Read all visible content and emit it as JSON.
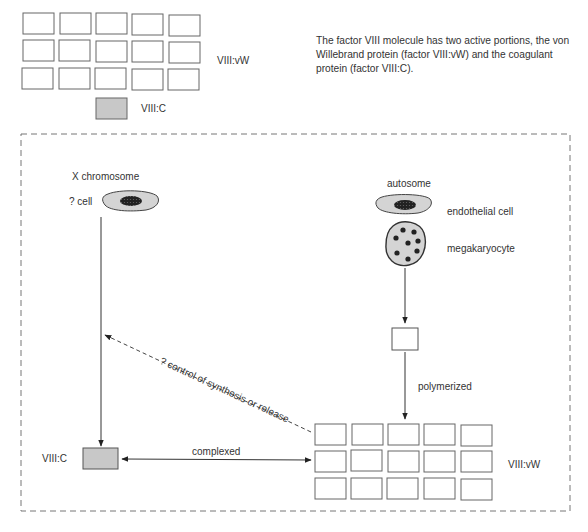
{
  "description": "The factor VIII molecule has two active portions, the von Willebrand protein (factor VIII:vW) and the coagulant protein (factor VIII:C).",
  "legend": {
    "vw_label": "VIII:vW",
    "c_label": "VIII:C"
  },
  "left_pathway": {
    "gene_label": "X chromosome",
    "cell_label": "? cell",
    "product_label": "VIII:C"
  },
  "right_pathway": {
    "gene_label": "autosome",
    "cell1_label": "endothelial cell",
    "cell2_label": "megakaryocyte",
    "step_label": "polymerized",
    "product_label": "VIII:vW"
  },
  "interactions": {
    "complex_label": "complexed",
    "feedback_label": "? control of synthesis or release"
  },
  "colors": {
    "box_stroke": "#666666",
    "vc_fill": "#c8c8c8",
    "cell_fill": "#d4d4d4",
    "nucleus_fill": "#222222",
    "dash_stroke": "#777777"
  }
}
